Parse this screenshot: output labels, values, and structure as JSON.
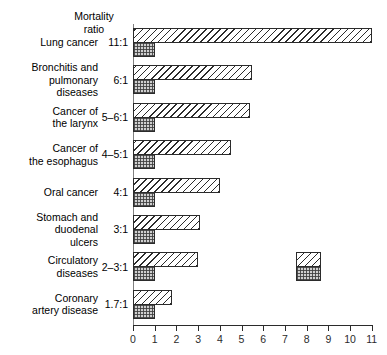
{
  "header": {
    "line1": "Mortality",
    "line2": "ratio"
  },
  "axis": {
    "ticks": [
      "0",
      "1",
      "2",
      "3",
      "4",
      "5",
      "6",
      "7",
      "8",
      "9",
      "10",
      "11"
    ]
  },
  "legend": {
    "items": [
      {
        "key": "smokers-swatch",
        "pattern": "hatched"
      },
      {
        "key": "nonsmokers-swatch",
        "pattern": "stippled"
      }
    ]
  },
  "rows": [
    {
      "label": "Lung cancer",
      "ratio": "11:1",
      "smokers": 11.0,
      "nonsmokers": 1.0
    },
    {
      "label": "Bronchitis and pulmonary diseases",
      "ratio": "6:1",
      "smokers": 5.5,
      "nonsmokers": 1.0
    },
    {
      "label": "Cancer of the larynx",
      "ratio": "5–6:1",
      "smokers": 5.4,
      "nonsmokers": 1.0
    },
    {
      "label": "Cancer of the esophagus",
      "ratio": "4–5:1",
      "smokers": 4.5,
      "nonsmokers": 1.0
    },
    {
      "label": "Oral cancer",
      "ratio": "4:1",
      "smokers": 4.0,
      "nonsmokers": 1.0
    },
    {
      "label": "Stomach and duodenal ulcers",
      "ratio": "3:1",
      "smokers": 3.1,
      "nonsmokers": 1.0
    },
    {
      "label": "Circulatory diseases",
      "ratio": "2–3:1",
      "smokers": 3.0,
      "nonsmokers": 1.0
    },
    {
      "label": "Coronary artery disease",
      "ratio": "1.7:1",
      "smokers": 1.8,
      "nonsmokers": 1.0
    }
  ],
  "chart_data": {
    "type": "bar",
    "orientation": "horizontal",
    "title": "",
    "xlabel": "",
    "ylabel": "",
    "xlim": [
      0,
      11
    ],
    "grid": false,
    "legend_position": "inside-right",
    "categories": [
      "Lung cancer",
      "Bronchitis and pulmonary diseases",
      "Cancer of the larynx",
      "Cancer of the esophagus",
      "Oral cancer",
      "Stomach and duodenal ulcers",
      "Circulatory diseases",
      "Coronary artery disease"
    ],
    "annotations": [
      "Mortality ratio 11:1",
      "Mortality ratio 6:1",
      "Mortality ratio 5–6:1",
      "Mortality ratio 4–5:1",
      "Mortality ratio 4:1",
      "Mortality ratio 3:1",
      "Mortality ratio 2–3:1",
      "Mortality ratio 1.7:1"
    ],
    "series": [
      {
        "name": "hatched",
        "values": [
          11.0,
          5.5,
          5.4,
          4.5,
          4.0,
          3.1,
          3.0,
          1.8
        ]
      },
      {
        "name": "stippled",
        "values": [
          1.0,
          1.0,
          1.0,
          1.0,
          1.0,
          1.0,
          1.0,
          1.0
        ]
      }
    ],
    "xticks": [
      0,
      1,
      2,
      3,
      4,
      5,
      6,
      7,
      8,
      9,
      10,
      11
    ]
  }
}
